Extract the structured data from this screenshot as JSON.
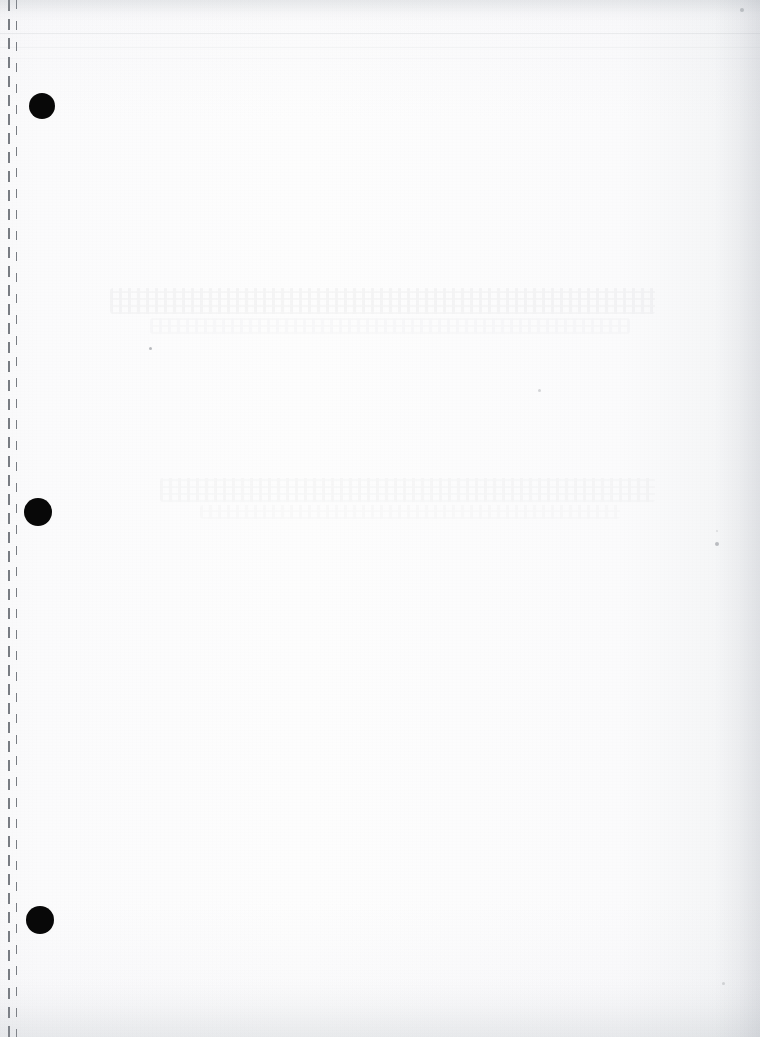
{
  "page": {
    "kind": "scanned-blank-page",
    "caption": "",
    "width": 760,
    "height": 1037,
    "paper_color": "#fdfdfd",
    "ink_color": "#080808"
  },
  "binder": {
    "punch_holes": [
      {
        "name": "punch-hole-top",
        "cx": 42,
        "cy": 106,
        "r": 13
      },
      {
        "name": "punch-hole-middle",
        "cx": 38,
        "cy": 512,
        "r": 14
      },
      {
        "name": "punch-hole-bottom",
        "cx": 40,
        "cy": 920,
        "r": 14
      }
    ],
    "perforation": {
      "x": 8,
      "dash_length": 11,
      "gap_length": 8,
      "color": "#787c82"
    },
    "perforation_secondary": {
      "x": 16,
      "color": "#787c82"
    }
  },
  "artifacts": {
    "scan_lines": [
      {
        "name": "scan-line-upper",
        "y": 33,
        "opacity": 0.16,
        "color": "#9aa0a8"
      },
      {
        "name": "scan-line-lower",
        "y": 47,
        "opacity": 0.09,
        "color": "#a9aeb5"
      },
      {
        "name": "scan-line-faint",
        "y": 58,
        "opacity": 0.05,
        "color": "#b4b9c0"
      }
    ],
    "bleed_bands": [
      {
        "name": "bleed-band-upper",
        "x": 110,
        "y": 288,
        "w": 545,
        "h": 26,
        "opacity": 0.03
      },
      {
        "name": "bleed-band-upper-2",
        "x": 150,
        "y": 318,
        "w": 480,
        "h": 16,
        "opacity": 0.016
      },
      {
        "name": "bleed-band-middle",
        "x": 160,
        "y": 478,
        "w": 495,
        "h": 24,
        "opacity": 0.022
      },
      {
        "name": "bleed-band-middle-2",
        "x": 200,
        "y": 505,
        "w": 420,
        "h": 14,
        "opacity": 0.012
      }
    ],
    "specks": [
      {
        "name": "speck-top-right",
        "x": 740,
        "y": 8,
        "size": 4,
        "opacity": 0.3
      },
      {
        "name": "speck-left-mid",
        "x": 149,
        "y": 347,
        "size": 3,
        "opacity": 0.38
      },
      {
        "name": "speck-center",
        "x": 538,
        "y": 389,
        "size": 3,
        "opacity": 0.22
      },
      {
        "name": "speck-right-mid",
        "x": 715,
        "y": 542,
        "size": 4,
        "opacity": 0.34
      },
      {
        "name": "speck-right-low",
        "x": 716,
        "y": 530,
        "size": 2,
        "opacity": 0.16
      },
      {
        "name": "speck-bottom-right",
        "x": 722,
        "y": 982,
        "size": 3,
        "opacity": 0.2
      }
    ]
  }
}
